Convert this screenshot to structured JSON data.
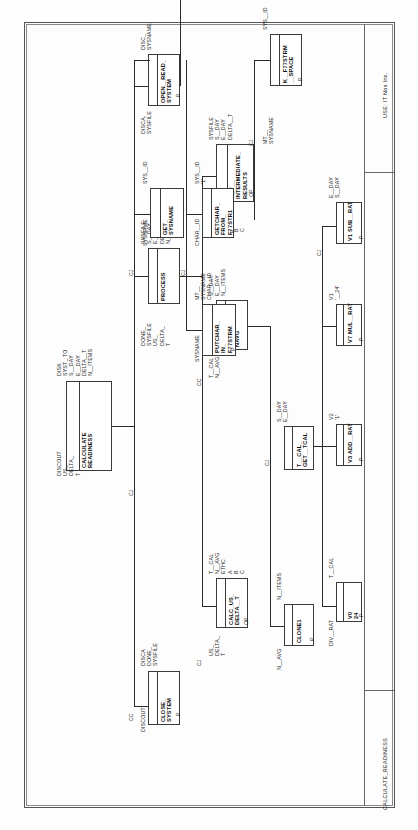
{
  "sheet": {
    "title_block_company": "USE: IT Nos Inc.",
    "title_block_drawing": "CALCULATE_READINESS"
  },
  "diagram": {
    "type": "structure-chart",
    "orientation": "rotated-90-ccw",
    "root_label": "CALCULATE_READINESS"
  },
  "nodes": [
    {
      "id": "calculate_readiness",
      "name": "CALCULATE\nREADINESS",
      "inputs": "DISCOUT\nUS_\nDELTA_\nT",
      "outputs": "DISK\nSYST_ TO\nS__DAY\nE__DAY\nDELTA__T\nN__ITEMS",
      "mark": ""
    },
    {
      "id": "close_system",
      "name": "CLOSE_\nSYSTEM",
      "inputs": "DISCOUT",
      "outputs": "DISCA\nDONE_\nSYSFILE",
      "mark": "P"
    },
    {
      "id": "process",
      "name": "PROCESS",
      "inputs": "DONE_\nSYSFILE\nUS_\nDELTA_\nT",
      "outputs": "SYSFILE\nS__DAY\nE__DAY\nDELTA__T\nN__ITEMS",
      "mark": ""
    },
    {
      "id": "open_read_system",
      "name": "OPEN__READ_\nSYSTEM",
      "inputs": "DISCA,\nSYSFILE",
      "outputs": "DISC_\nSYSNAME",
      "mark": "P"
    },
    {
      "id": "calc_us_delta_t",
      "name": "CALC_US_\nDELTA__T",
      "inputs": "US_\nDELTA_\nT",
      "outputs": "T__CAL\nN__AVG\nETHC\nA\nB\nC",
      "mark": "OP"
    },
    {
      "id": "calc_tcal_navg",
      "name": "CALC__TCAL_\nNAVG",
      "inputs": "T__CAL\nN__AVG",
      "outputs": "S__DAY\nE__DAY\nN__ITEMS",
      "mark": ""
    },
    {
      "id": "get_intermediate_results",
      "name": "GET__\nINTERMEDIATE_\nRESULTS",
      "inputs": "DONE_\nSYSFILE\nETHC\nA\nB\nC",
      "outputs": "SYSFILE\nS__DAY\nE__DAY\nDELTA__T",
      "mark": "OP"
    },
    {
      "id": "clone1",
      "name": "CLONE1",
      "inputs": "N__AVG",
      "outputs": "N__ITEMS",
      "mark": "P"
    },
    {
      "id": "tcal_get_tcal",
      "name": "T__CAL_\nGET__TCAL",
      "inputs": "",
      "outputs": "S__DAY\nE__DAY",
      "mark": ""
    },
    {
      "id": "v0_24",
      "name": "V0\n24",
      "inputs": "T__CAL",
      "outputs": "DIV__RAT",
      "mark": "P"
    },
    {
      "id": "v3_add_rat",
      "name": "V3 ADD__RAT",
      "inputs": "",
      "outputs": "V2\n'1'",
      "mark": "P"
    },
    {
      "id": "v7_mul_rat",
      "name": "V7 MUL__RAT",
      "inputs": "",
      "outputs": "V1\n'__24'",
      "mark": "P"
    },
    {
      "id": "v1_sub_rat",
      "name": "V1 SUB__RAT",
      "inputs": "",
      "outputs": "E__DAY\nS__DAY",
      "mark": "P"
    },
    {
      "id": "sysname_putchar",
      "name": "PUTCHAR_\nIN_\nF77STRM",
      "inputs": "SYSNAME",
      "outputs": "MT__\nSYSNAME\nCHAR__ID",
      "mark": "P"
    },
    {
      "id": "get_sysname",
      "name": "GET_\nSYSNAME",
      "inputs": "SYSNAME",
      "outputs": "SYS__ID",
      "mark": ""
    },
    {
      "id": "getchar_from_f77str1",
      "name": "GETCHAR_\nFROM_\nF77STR1",
      "inputs": "CHAR__ID",
      "outputs": "SYS__ID\n'1'",
      "mark": "P"
    },
    {
      "id": "k_f77strm_space",
      "name": "K__F77STRM\n__SPACE",
      "inputs": "MT__\nSYSNAME",
      "outputs": "SYS__ID",
      "mark": "P"
    }
  ],
  "connector_labels": [
    {
      "id": "cc1",
      "text": "CC"
    },
    {
      "id": "cc2",
      "text": "CC"
    },
    {
      "id": "cj1",
      "text": "CJ"
    },
    {
      "id": "cj2",
      "text": "CJ"
    },
    {
      "id": "cj3",
      "text": "CJ"
    },
    {
      "id": "cj4",
      "text": "CJ"
    },
    {
      "id": "cj5",
      "text": "CJ"
    },
    {
      "id": "cj6",
      "text": "CJ"
    },
    {
      "id": "cj7",
      "text": "CJ"
    },
    {
      "id": "cj8",
      "text": "CJ"
    }
  ]
}
